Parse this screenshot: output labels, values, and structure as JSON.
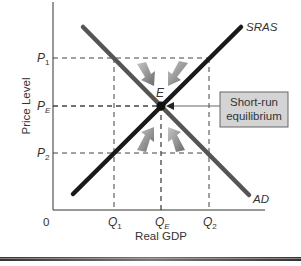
{
  "diagram": {
    "type": "AD-SRAS short-run equilibrium",
    "y_axis_label": "Price Level",
    "x_axis_label": "Real GDP",
    "origin_label": "0",
    "price_ticks": [
      {
        "base": "P",
        "sub": "1"
      },
      {
        "base": "P",
        "sub": "E"
      },
      {
        "base": "P",
        "sub": "2"
      }
    ],
    "quantity_ticks": [
      {
        "base": "Q",
        "sub": "1"
      },
      {
        "base": "Q",
        "sub": "E"
      },
      {
        "base": "Q",
        "sub": "2"
      }
    ],
    "curves": {
      "sras_label": "SRAS",
      "ad_label": "AD"
    },
    "equilibrium_point_label": "E",
    "callout": {
      "line1": "Short-run",
      "line2": "equilibrium"
    },
    "colors": {
      "sras": "#1a1a1a",
      "ad": "#555555",
      "arrows": "#8a8a8a",
      "callout_fill": "#d4d4d4",
      "axis": "#333333",
      "dashed": "#444444"
    }
  }
}
